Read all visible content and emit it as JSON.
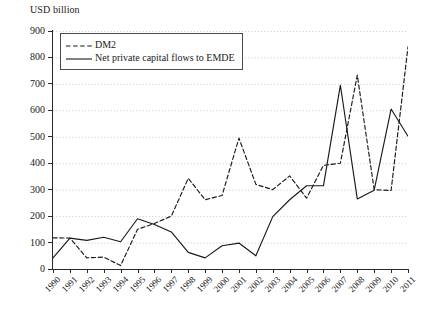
{
  "chart_data": {
    "type": "line",
    "title": "",
    "ylabel": "USD billion",
    "xlabel": "",
    "ylim": [
      0,
      900
    ],
    "ytick_step": 100,
    "yticks": [
      0,
      100,
      200,
      300,
      400,
      500,
      600,
      700,
      800,
      900
    ],
    "grid": "horizontal-dotted",
    "legend_position": "top-left",
    "categories": [
      "1990",
      "1991",
      "1992",
      "1993",
      "1994",
      "1995",
      "1996",
      "1997",
      "1998",
      "1999",
      "2000",
      "2001",
      "2002",
      "2003",
      "2004",
      "2005",
      "2006",
      "2007",
      "2008",
      "2009",
      "2010",
      "2011"
    ],
    "series": [
      {
        "name": "DM2",
        "style": "dashed",
        "color": "#1a1a1a",
        "values": [
          118,
          117,
          42,
          45,
          13,
          150,
          172,
          200,
          343,
          262,
          278,
          495,
          320,
          300,
          352,
          268,
          392,
          400,
          733,
          300,
          297,
          840
        ]
      },
      {
        "name": "Net private capital flows to EMDE",
        "style": "solid",
        "color": "#1a1a1a",
        "values": [
          42,
          117,
          108,
          120,
          103,
          190,
          168,
          140,
          63,
          42,
          88,
          98,
          50,
          198,
          262,
          315,
          315,
          695,
          265,
          298,
          605,
          502
        ]
      }
    ]
  },
  "legend": {
    "entries": [
      {
        "label": "DM2",
        "style": "dashed"
      },
      {
        "label": "Net private capital flows to EMDE",
        "style": "solid"
      }
    ]
  }
}
